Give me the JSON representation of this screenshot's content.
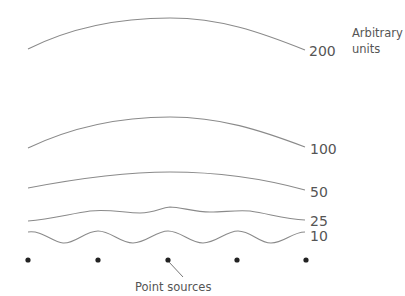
{
  "diagram": {
    "units_label_line1": "Arbitrary",
    "units_label_line2": "units",
    "contours": [
      {
        "value": "200",
        "label": "200"
      },
      {
        "value": "100",
        "label": "100"
      },
      {
        "value": "50",
        "label": "50"
      },
      {
        "value": "25",
        "label": "25"
      },
      {
        "value": "10",
        "label": "10"
      }
    ],
    "point_sources": {
      "count": 5,
      "label": "Point sources"
    }
  },
  "colors": {
    "curve": "#8a8a8a",
    "text": "#555555",
    "dot": "#222222",
    "background": "#ffffff"
  }
}
